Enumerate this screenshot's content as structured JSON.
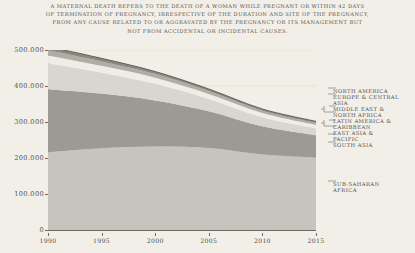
{
  "title": {
    "lines": [
      "A maternal death refers to the death of a woman while pregnant or within 42 days",
      "of termination of pregnancy, irrespective of the duration and site of the pregnancy,",
      "from any cause related to or aggravated by the pregnancy or its management but",
      "not from accidental or incidental causes."
    ]
  },
  "axes": {
    "y_ticks": [
      "0",
      "100.000",
      "200.000",
      "300.000",
      "400.000",
      "500.000"
    ],
    "x_ticks": [
      "1990",
      "1995",
      "2000",
      "2005",
      "2010",
      "2015"
    ]
  },
  "legend": {
    "items": [
      "North America",
      "Europe & Central\nAsia",
      "Middle East &\nNorth Africa",
      "Latin America &\nCaribbean",
      "East Asia &\nPacific",
      "South Asia"
    ],
    "far_item": "Sub-Saharan\nAfrica"
  },
  "colors": {
    "background": "#f2efe9",
    "axis": "#6f6a61",
    "text": "#55504a",
    "sub_saharan_africa": "#c7c4bd",
    "south_asia": "#9d9a93",
    "east_asia_pacific": "#d9d6cf",
    "latin_america_caribbean": "#f0ede7",
    "middle_east_north_africa": "#b0ada6",
    "europe_central_asia": "#8b8881",
    "north_america": "#55524c"
  },
  "chart_data": {
    "type": "area",
    "xlabel": "",
    "ylabel": "",
    "x": [
      1990,
      1995,
      2000,
      2005,
      2010,
      2015
    ],
    "xlim": [
      1990,
      2015
    ],
    "ylim": [
      0,
      500000
    ],
    "grid": true,
    "legend_position": "right",
    "stacked": true,
    "categories": [
      1990,
      1995,
      2000,
      2005,
      2010,
      2015
    ],
    "series": [
      {
        "name": "Sub-Saharan Africa",
        "values": [
          216000,
          227000,
          232000,
          228000,
          210000,
          201000
        ]
      },
      {
        "name": "South Asia",
        "values": [
          175000,
          152000,
          128000,
          102000,
          78000,
          62000
        ]
      },
      {
        "name": "East Asia & Pacific",
        "values": [
          72000,
          58000,
          46000,
          34000,
          25000,
          19000
        ]
      },
      {
        "name": "Latin America & Caribbean",
        "values": [
          22000,
          19000,
          17000,
          14000,
          12000,
          10000
        ]
      },
      {
        "name": "Middle East & North Africa",
        "values": [
          14000,
          12000,
          10000,
          8000,
          6500,
          5500
        ]
      },
      {
        "name": "Europe & Central Asia",
        "values": [
          9000,
          7500,
          6000,
          4500,
          3500,
          3000
        ]
      },
      {
        "name": "North America",
        "values": [
          1500,
          1400,
          1300,
          1300,
          1300,
          1300
        ]
      }
    ],
    "totals": [
      509500,
      476900,
      440300,
      391800,
      336300,
      301800
    ]
  }
}
